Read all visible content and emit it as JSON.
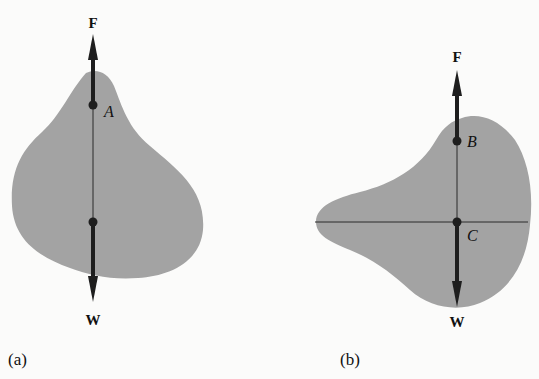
{
  "figure": {
    "panels": [
      {
        "id": "a",
        "caption": "(a)",
        "force_up_label": "F",
        "force_down_label": "W",
        "point_label": "A",
        "colors": {
          "body": "#a3a3a3",
          "arrow": "#1e1e1e",
          "line": "#2a2a2a"
        }
      },
      {
        "id": "b",
        "caption": "(b)",
        "force_up_label": "F",
        "force_down_label": "W",
        "point_label_upper": "B",
        "point_label_lower": "C",
        "colors": {
          "body": "#a3a3a3",
          "arrow": "#1e1e1e",
          "line": "#2a2a2a"
        }
      }
    ]
  }
}
